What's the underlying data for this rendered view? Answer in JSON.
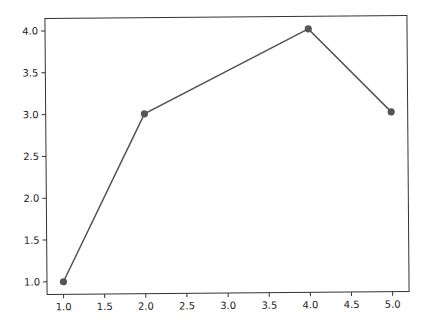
{
  "chart_data": {
    "type": "line",
    "title": "",
    "xlabel": "",
    "ylabel": "",
    "x": [
      1.0,
      2.0,
      4.0,
      5.0
    ],
    "series": [
      {
        "name": "",
        "values": [
          1.0,
          3.0,
          4.0,
          3.0
        ],
        "color": "#555555",
        "marker": "circle"
      }
    ],
    "xlim": [
      0.8,
      5.2
    ],
    "ylim": [
      0.85,
      4.15
    ],
    "xticks": [
      "1.0",
      "1.5",
      "2.0",
      "2.5",
      "3.0",
      "3.5",
      "4.0",
      "4.5",
      "5.0"
    ],
    "yticks": [
      "1.0",
      "1.5",
      "2.0",
      "2.5",
      "3.0",
      "3.5",
      "4.0"
    ],
    "grid": false,
    "legend": null
  },
  "colors": {
    "line": "#555555",
    "axes": "#333333",
    "text": "#222222",
    "background": "#ffffff"
  }
}
